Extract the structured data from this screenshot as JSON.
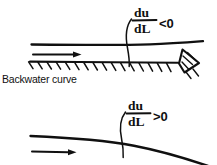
{
  "figure": {
    "background_color": "#ffffff",
    "ink_color": "#101010",
    "style": "hand-drawn line sketch"
  },
  "panels": [
    {
      "id": "upper",
      "name": "backwater-curve-decreasing-velocity",
      "caption": "Backwater curve",
      "formula": {
        "numerator": "du",
        "denominator": "dL",
        "relation": "<0",
        "full": "du/dL <0"
      },
      "flow_arrow": "flow-direction-arrow",
      "channel_bed": "hatched-horizontal-bed",
      "obstruction": "triangular-weir"
    },
    {
      "id": "lower",
      "name": "drawdown-curve-increasing-velocity",
      "caption": "",
      "formula": {
        "numerator": "du",
        "denominator": "dL",
        "relation": ">0",
        "full": "du/dL >0"
      },
      "flow_arrow": "flow-direction-arrow",
      "channel_bed": "",
      "obstruction": ""
    }
  ]
}
